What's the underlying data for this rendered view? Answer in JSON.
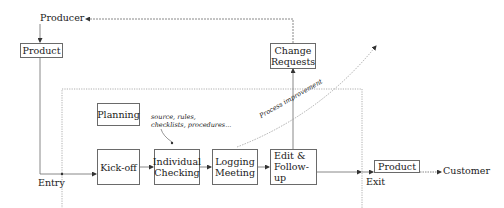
{
  "diagram": {
    "producer_label": "Producer",
    "customer_label": "Customer",
    "entry_label": "Entry",
    "exit_label": "Exit",
    "input_product_label": "Product",
    "output_product_label": "Product",
    "change_requests": {
      "line1": "Change",
      "line2": "Requests"
    },
    "planning_label": "Planning",
    "annotation": {
      "line1": "source, rules,",
      "line2": "checklists, procedures..."
    },
    "process_improvement_label": "Process improvement",
    "steps": [
      {
        "line1": "Kick-off",
        "line2": ""
      },
      {
        "line1": "Individual",
        "line2": "Checking"
      },
      {
        "line1": "Logging",
        "line2": "Meeting"
      },
      {
        "line1": "Edit &",
        "line2": "Follow-up"
      }
    ],
    "colors": {
      "line": "#6a6a6a",
      "dotted": "#9a9a9a",
      "text": "#1a1a1a"
    }
  }
}
